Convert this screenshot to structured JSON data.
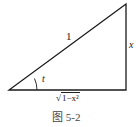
{
  "figure": {
    "caption": "图 5-2",
    "labels": {
      "hypotenuse": "1",
      "opposite": "x",
      "angle": "t",
      "adjacent_radical_sign": "√",
      "adjacent_radicand": "1−x²"
    },
    "colors": {
      "stroke": "#1a1a1a",
      "background": "#ffffff"
    }
  }
}
